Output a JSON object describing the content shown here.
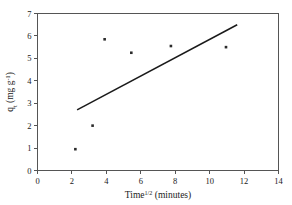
{
  "chart_data": {
    "type": "scatter",
    "title": "",
    "xlabel": "Time^1/2 (minutes)",
    "xlabel_base": "Time",
    "xlabel_exponent": "1/2",
    "xlabel_units": " (minutes)",
    "ylabel": "q_t (mg g^-1)",
    "ylabel_symbol": "q",
    "ylabel_subscript": "t",
    "ylabel_units": " (mg g",
    "ylabel_unit_exponent": "-1",
    "ylabel_units_close": ")",
    "xlim": [
      0,
      14
    ],
    "ylim": [
      0,
      7
    ],
    "xticks": [
      0,
      2,
      4,
      6,
      8,
      10,
      12,
      14
    ],
    "yticks": [
      0,
      1,
      2,
      3,
      4,
      5,
      6,
      7
    ],
    "xtick_labels": [
      "0",
      "2",
      "4",
      "6",
      "8",
      "10",
      "12",
      "14"
    ],
    "ytick_labels": [
      "0",
      "1",
      "2",
      "3",
      "4",
      "5",
      "6",
      "7"
    ],
    "grid": false,
    "legend": null,
    "marker_color": "#2b2b2b",
    "line_color": "#1a1a1a",
    "frame_color": "#555555",
    "points": [
      {
        "x": 2.2,
        "y": 0.95
      },
      {
        "x": 3.2,
        "y": 2.0
      },
      {
        "x": 3.9,
        "y": 5.85
      },
      {
        "x": 5.45,
        "y": 5.25
      },
      {
        "x": 7.75,
        "y": 5.55
      },
      {
        "x": 10.95,
        "y": 5.5
      }
    ],
    "trend_line": {
      "x0": 2.3,
      "y0": 2.7,
      "x1": 11.6,
      "y1": 6.5
    }
  }
}
